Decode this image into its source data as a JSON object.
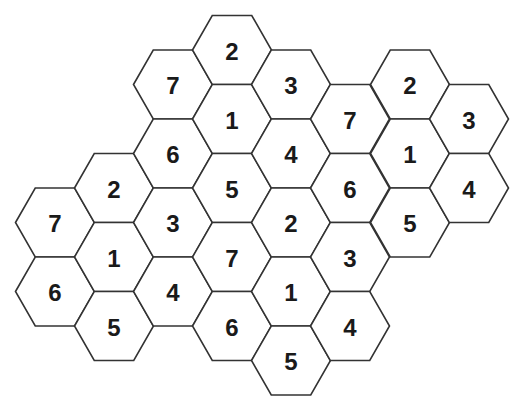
{
  "puzzle": {
    "type": "hexagonal number grid",
    "hex_radius": 39.5,
    "hex_height": 69,
    "line_color": "#333333",
    "cells": [
      {
        "col": 0,
        "cx": 55,
        "cy": 222.5,
        "value": "7"
      },
      {
        "col": 0,
        "cx": 55,
        "cy": 291.5,
        "value": "6"
      },
      {
        "col": 1,
        "cx": 114,
        "cy": 188,
        "value": "2"
      },
      {
        "col": 1,
        "cx": 114,
        "cy": 257,
        "value": "1"
      },
      {
        "col": 1,
        "cx": 114,
        "cy": 326,
        "value": "5"
      },
      {
        "col": 2,
        "cx": 173,
        "cy": 84.5,
        "value": "7"
      },
      {
        "col": 2,
        "cx": 173,
        "cy": 153.5,
        "value": "6"
      },
      {
        "col": 2,
        "cx": 173,
        "cy": 222.5,
        "value": "3"
      },
      {
        "col": 2,
        "cx": 173,
        "cy": 291.5,
        "value": "4"
      },
      {
        "col": 3,
        "cx": 232,
        "cy": 50,
        "value": "2"
      },
      {
        "col": 3,
        "cx": 232,
        "cy": 119,
        "value": "1"
      },
      {
        "col": 3,
        "cx": 232,
        "cy": 188,
        "value": "5"
      },
      {
        "col": 3,
        "cx": 232,
        "cy": 257,
        "value": "7"
      },
      {
        "col": 3,
        "cx": 232,
        "cy": 326,
        "value": "6"
      },
      {
        "col": 4,
        "cx": 291,
        "cy": 84.5,
        "value": "3"
      },
      {
        "col": 4,
        "cx": 291,
        "cy": 153.5,
        "value": "4"
      },
      {
        "col": 4,
        "cx": 291,
        "cy": 222.5,
        "value": "2"
      },
      {
        "col": 4,
        "cx": 291,
        "cy": 291.5,
        "value": "1"
      },
      {
        "col": 4,
        "cx": 291,
        "cy": 360.5,
        "value": "5"
      },
      {
        "col": 5,
        "cx": 350,
        "cy": 119,
        "value": "7"
      },
      {
        "col": 5,
        "cx": 350,
        "cy": 188,
        "value": "6"
      },
      {
        "col": 5,
        "cx": 350,
        "cy": 257,
        "value": "3"
      },
      {
        "col": 5,
        "cx": 350,
        "cy": 326,
        "value": "4"
      },
      {
        "col": 6,
        "cx": 410,
        "cy": 84.5,
        "value": "2"
      },
      {
        "col": 6,
        "cx": 410,
        "cy": 153.5,
        "value": "1"
      },
      {
        "col": 6,
        "cx": 410,
        "cy": 222.5,
        "value": "5"
      },
      {
        "col": 7,
        "cx": 469,
        "cy": 119,
        "value": "3"
      },
      {
        "col": 7,
        "cx": 469,
        "cy": 188,
        "value": "4"
      }
    ]
  }
}
